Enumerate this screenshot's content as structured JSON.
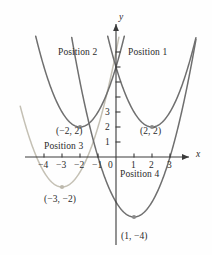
{
  "chart_data": {
    "type": "line",
    "title": "",
    "xlabel": "x",
    "ylabel": "y",
    "xlim": [
      -5,
      3.6
    ],
    "ylim": [
      -5.6,
      6.2
    ],
    "grid": false,
    "legend_position": "inline-annotations",
    "x_ticks": [
      "-4",
      "-3",
      "-2",
      "-1",
      "0",
      "1",
      "2",
      "3"
    ],
    "x_tick_values": [
      -4,
      -3,
      -2,
      -1,
      0,
      1,
      2,
      3
    ],
    "y_ticks": [
      "1",
      "2",
      "3"
    ],
    "y_tick_values": [
      1,
      2,
      3
    ],
    "series": [
      {
        "name": "Position 1",
        "equation": "y = (x - 2)^2 + 2",
        "vertex": [
          2,
          2
        ],
        "vertex_label": "(2, 2)",
        "color": "#6f6f6f",
        "a": 1
      },
      {
        "name": "Position 2",
        "equation": "y = (x + 2)^2 + 2",
        "vertex": [
          -2,
          2
        ],
        "vertex_label": "(-2, 2)",
        "color": "#6f6f6f",
        "a": 1
      },
      {
        "name": "Position 3",
        "equation": "y = (x + 3)^2 - 2",
        "vertex": [
          -3,
          -2
        ],
        "vertex_label": "(-3, -2)",
        "color": "#c4c0b4",
        "a": 1
      },
      {
        "name": "Position 4",
        "equation": "y = (x - 1)^2 - 4",
        "vertex": [
          1,
          -4
        ],
        "vertex_label": "(1, -4)",
        "color": "#6f6f6f",
        "a": 1
      }
    ],
    "annotations": [
      {
        "text": "Position 2",
        "x": -2.3,
        "y": 5.0
      },
      {
        "text": "Position 1",
        "x": 1.7,
        "y": 5.0
      },
      {
        "text": "Position 3",
        "x": -2.55,
        "y": 0.85
      },
      {
        "text": "Position 4",
        "x": 1.05,
        "y": -0.95
      },
      {
        "text": "(-2, 2)",
        "x": -2.05,
        "y": 1.25
      },
      {
        "text": "(2, 2)",
        "x": 2.05,
        "y": 1.25
      },
      {
        "text": "(-3, -2)",
        "x": -2.9,
        "y": -3.15
      },
      {
        "text": "(1, -4)",
        "x": 1.15,
        "y": -5.1
      }
    ]
  },
  "axes": {
    "x_axis_label": "x",
    "y_axis_label": "y",
    "origin_label": "0"
  },
  "ticks": {
    "x": [
      {
        "label": "-4",
        "value": -4
      },
      {
        "label": "-3",
        "value": -3
      },
      {
        "label": "-2",
        "value": -2
      },
      {
        "label": "-1",
        "value": -1
      },
      {
        "label": "0",
        "value": 0
      },
      {
        "label": "1",
        "value": 1
      },
      {
        "label": "2",
        "value": 2
      },
      {
        "label": "3",
        "value": 3
      }
    ],
    "y": [
      {
        "label": "1",
        "value": 1
      },
      {
        "label": "2",
        "value": 2
      },
      {
        "label": "3",
        "value": 3
      }
    ]
  },
  "labels": {
    "position1": "Position 1",
    "position2": "Position 2",
    "position3": "Position 3",
    "position4": "Position 4",
    "vertex1": "(2, 2)",
    "vertex2": "(−2, 2)",
    "vertex3": "(−3, −2)",
    "vertex4": "(1, −4)",
    "tick_x_m4": "−4",
    "tick_x_m3": "−3",
    "tick_x_m2": "−2",
    "tick_x_m1": "−1",
    "tick_x_0": "0",
    "tick_x_1": "1",
    "tick_x_2": "2",
    "tick_x_3": "3",
    "tick_y_1": "1",
    "tick_y_2": "2",
    "tick_y_3": "3",
    "axis_x": "x",
    "axis_y": "y"
  },
  "colors": {
    "curve_dark": "#6f6f6f",
    "curve_light": "#c4c0b4",
    "axis": "#3a3a3a",
    "text": "#2b2b2b",
    "marker_dark": "#8a8a8a",
    "marker_light": "#bdb9ad",
    "background": "#ffffff"
  }
}
